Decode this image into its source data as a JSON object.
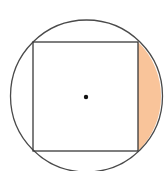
{
  "diagram": {
    "type": "geometry",
    "circle": {
      "cx": 86.5,
      "cy": 96,
      "r": 76,
      "stroke": "#4a4a4a"
    },
    "square": {
      "x1": 33,
      "y1": 42,
      "x2": 138,
      "y2": 151,
      "stroke": "#3a3a3a"
    },
    "center_dot": {
      "cx": 86,
      "cy": 97,
      "r": 2.2,
      "fill": "#111111"
    },
    "shaded_segment": {
      "side": "right",
      "fill": "#F9C49A"
    }
  }
}
